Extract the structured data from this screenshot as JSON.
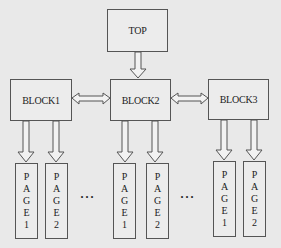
{
  "top": {
    "label": "TOP"
  },
  "blocks": [
    {
      "label": "BLOCK1"
    },
    {
      "label": "BLOCK2"
    },
    {
      "label": "BLOCK3"
    }
  ],
  "pages": [
    {
      "label": "PAGE1",
      "chars": [
        "P",
        "A",
        "G",
        "E",
        "1"
      ]
    },
    {
      "label": "PAGE2",
      "chars": [
        "P",
        "A",
        "G",
        "E",
        "2"
      ]
    }
  ],
  "ellipsis": "···"
}
